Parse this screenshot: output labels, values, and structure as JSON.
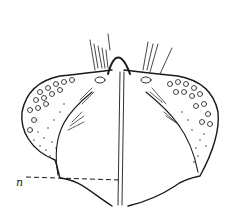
{
  "figure": {
    "type": "scientific line illustration",
    "labels": [
      {
        "id": "n",
        "text": "n",
        "x": 18,
        "y": 178
      }
    ],
    "colors": {
      "ink": "#1a1a1a",
      "paper": "#ffffff"
    }
  }
}
